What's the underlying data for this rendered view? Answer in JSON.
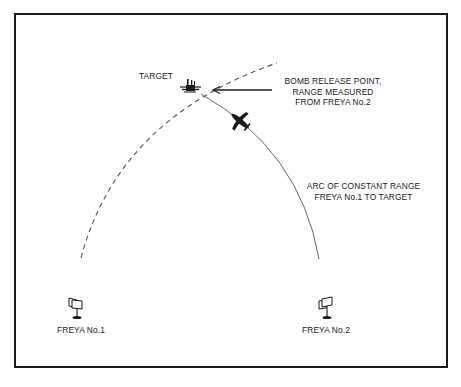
{
  "diagram": {
    "title": "",
    "labels": {
      "target": "TARGET",
      "bomb_release": {
        "lines": [
          "BOMB RELEASE POINT,",
          "RANGE MEASURED",
          "FROM FREYA No.2"
        ]
      },
      "arc": {
        "lines": [
          "ARC OF CONSTANT RANGE",
          "FREYA No.1 TO TARGET"
        ]
      },
      "freya1": "FREYA No.1",
      "freya2": "FREYA No.2"
    },
    "elements": {
      "target_icon": "target-ship-icon",
      "aircraft_icon": "bomber-aircraft-icon",
      "radar_icons": [
        "radar-antenna-icon",
        "radar-antenna-icon"
      ],
      "arrow": "arrow-left-icon",
      "arcs": [
        {
          "name": "range-arc-freya2",
          "style": "dashed"
        },
        {
          "name": "range-arc-freya1",
          "style": "solid"
        }
      ]
    },
    "colors": {
      "ink": "#1a1a1a",
      "arc": "#555555",
      "background": "#ffffff"
    }
  }
}
